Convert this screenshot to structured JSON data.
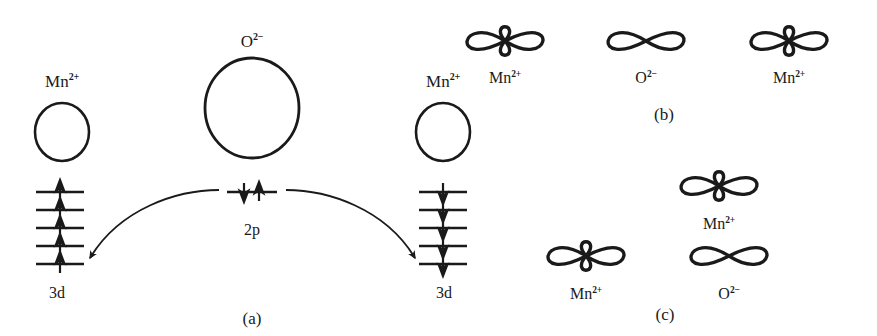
{
  "figure": {
    "ink_color": "#1a1a1a",
    "background_color": "#ffffff",
    "width": 877,
    "height": 336
  },
  "panel_a": {
    "caption": "(a)",
    "left_ion_label": "Mn",
    "left_ion_charge": "2+",
    "center_ion_label": "O",
    "center_ion_charge": "2−",
    "right_ion_label": "Mn",
    "right_ion_charge": "2+",
    "left_shell_label": "3d",
    "right_shell_label": "3d",
    "center_shell_label": "2p",
    "left_3d_levels": 5,
    "left_3d_spins": [
      "up",
      "up",
      "up",
      "up",
      "up"
    ],
    "right_3d_levels": 5,
    "right_3d_spins": [
      "down",
      "down",
      "down",
      "down",
      "down"
    ],
    "p_level_spins": [
      "down",
      "up"
    ],
    "transfer_arrows": 2
  },
  "panel_b": {
    "caption": "(b)",
    "orbitals": [
      {
        "label": "Mn",
        "charge": "2+",
        "type": "d-orbital"
      },
      {
        "label": "O",
        "charge": "2−",
        "type": "p-orbital"
      },
      {
        "label": "Mn",
        "charge": "2+",
        "type": "d-orbital"
      }
    ],
    "arrangement": "linear-180-degree"
  },
  "panel_c": {
    "caption": "(c)",
    "orbitals": [
      {
        "label": "Mn",
        "charge": "2+",
        "type": "d-orbital",
        "position": "top"
      },
      {
        "label": "Mn",
        "charge": "2+",
        "type": "d-orbital",
        "position": "bottom-left"
      },
      {
        "label": "O",
        "charge": "2−",
        "type": "p-orbital",
        "position": "bottom-right"
      }
    ],
    "arrangement": "right-angle-90-degree"
  }
}
